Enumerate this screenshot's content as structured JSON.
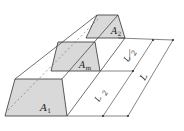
{
  "diagram": {
    "labels": {
      "a1": "A",
      "a1_sub": "1",
      "am": "A",
      "am_sub": "m",
      "a2": "A",
      "a2_sub": "2",
      "half_top_num": "L",
      "half_top_den": "2",
      "half_bottom_num": "L",
      "half_bottom_den": "2",
      "length": "L"
    },
    "colors": {
      "face_fill": "#d9d9d9",
      "line": "#333333"
    }
  }
}
